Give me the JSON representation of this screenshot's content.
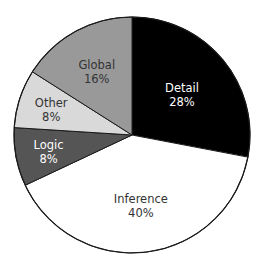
{
  "chart_data": {
    "type": "pie",
    "title": "",
    "start_angle": "12 o'clock",
    "direction": "clockwise",
    "legend": "none (labels inside slices)",
    "categories": [
      "Detail",
      "Inference",
      "Logic",
      "Other",
      "Global"
    ],
    "values": [
      28,
      40,
      8,
      8,
      16
    ],
    "labels": [
      "28%",
      "40%",
      "8%",
      "8%",
      "16%"
    ],
    "colors": [
      "#000000",
      "#ffffff",
      "#555555",
      "#d9d9d9",
      "#999999"
    ],
    "text_colors": [
      "#ffffff",
      "#333333",
      "#ffffff",
      "#333333",
      "#333333"
    ]
  },
  "geometry": {
    "cx": 132,
    "cy": 135,
    "r": 118
  }
}
